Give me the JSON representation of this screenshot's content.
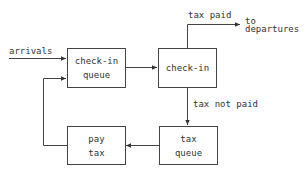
{
  "diagram": {
    "type": "flowchart",
    "nodes": {
      "checkin_queue": {
        "line1": "check-in",
        "line2": "queue"
      },
      "checkin": {
        "line1": "check-in"
      },
      "tax_queue": {
        "line1": "tax",
        "line2": "queue"
      },
      "pay_tax": {
        "line1": "pay",
        "line2": "tax"
      }
    },
    "labels": {
      "arrivals": "arrivals",
      "tax_paid": "tax paid",
      "to": "to",
      "departures": "departures",
      "tax_not_paid": "tax not paid"
    },
    "edges": [
      {
        "from": "arrivals",
        "to": "check-in queue"
      },
      {
        "from": "check-in queue",
        "to": "check-in"
      },
      {
        "from": "check-in",
        "to": "departures",
        "label": "tax paid"
      },
      {
        "from": "check-in",
        "to": "tax queue",
        "label": "tax not paid"
      },
      {
        "from": "tax queue",
        "to": "pay tax"
      },
      {
        "from": "pay tax",
        "to": "check-in queue"
      }
    ]
  }
}
